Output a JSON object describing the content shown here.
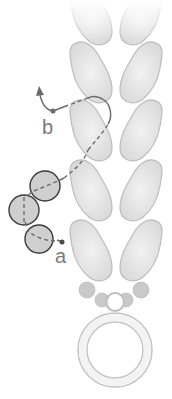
{
  "diagram": {
    "type": "beading-thread-path",
    "labels": {
      "start": "a",
      "end": "b"
    },
    "colors": {
      "background": "#ffffff",
      "leaf_bead_fill": "#e2e2e2",
      "leaf_bead_stroke": "#b9b9b9",
      "round_bead_fill": "#cfcfcf",
      "round_bead_stroke": "#3a3a3a",
      "thread": "#6e6e6e",
      "small_bead_fill": "#c8c8c8",
      "ring_stroke": "#bdbdbd"
    },
    "leaf_beads": {
      "columns": 2,
      "rows": 5,
      "note": "top row faded"
    },
    "round_beads_count": 3,
    "small_beads_count": 4,
    "ring": "jump ring"
  }
}
